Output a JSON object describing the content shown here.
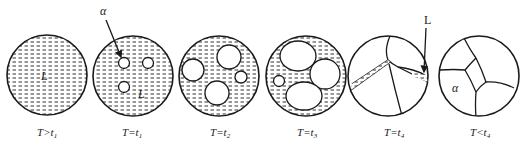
{
  "figure": {
    "title": "",
    "colors": {
      "ink": "#1a1a1a",
      "liquid_hatch": "#333333",
      "background": "#ffffff"
    },
    "stages": [
      {
        "id": "stage-1",
        "label_T": "T",
        "label_op": ">",
        "label_t": "t",
        "label_sub": "1",
        "phase_labels": [
          "L"
        ]
      },
      {
        "id": "stage-2",
        "label_T": "T",
        "label_op": "=",
        "label_t": "t",
        "label_sub": "1",
        "phase_labels": [
          "α",
          "L"
        ]
      },
      {
        "id": "stage-3",
        "label_T": "T",
        "label_op": "=",
        "label_t": "t",
        "label_sub": "2",
        "phase_labels": []
      },
      {
        "id": "stage-4",
        "label_T": "T",
        "label_op": "=",
        "label_t": "t",
        "label_sub": "3",
        "phase_labels": []
      },
      {
        "id": "stage-5",
        "label_T": "T",
        "label_op": "=",
        "label_t": "t",
        "label_sub": "4",
        "phase_labels": [
          "L"
        ]
      },
      {
        "id": "stage-6",
        "label_T": "T",
        "label_op": "<",
        "label_t": "t",
        "label_sub": "4",
        "phase_labels": [
          "α"
        ]
      }
    ],
    "annotations": {
      "alpha_arrow_label": "α",
      "liquid_arrow_label": "L",
      "liquid_label_stage1": "L",
      "liquid_label_stage2": "L",
      "alpha_label_stage6": "α"
    }
  }
}
